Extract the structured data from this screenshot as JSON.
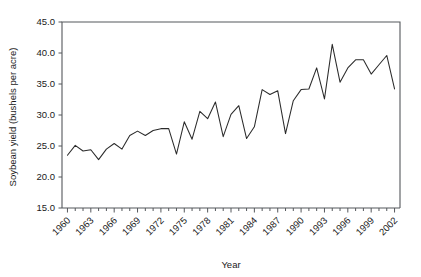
{
  "chart_data": {
    "type": "line",
    "title": "",
    "xlabel": "Year",
    "ylabel": "Soybean yield (bushels per acre)",
    "xlim": [
      1959.3,
      2002.7
    ],
    "ylim": [
      15.0,
      45.0
    ],
    "grid": false,
    "legend": false,
    "y_ticks": [
      "15.0",
      "20.0",
      "25.0",
      "30.0",
      "35.0",
      "40.0",
      "45.0"
    ],
    "y_tick_values": [
      15.0,
      20.0,
      25.0,
      30.0,
      35.0,
      40.0,
      45.0
    ],
    "x_ticks": [
      "1960",
      "1963",
      "1966",
      "1969",
      "1972",
      "1975",
      "1978",
      "1981",
      "1984",
      "1987",
      "1990",
      "1993",
      "1996",
      "1999",
      "2002"
    ],
    "x_tick_values": [
      1960,
      1963,
      1966,
      1969,
      1972,
      1975,
      1978,
      1981,
      1984,
      1987,
      1990,
      1993,
      1996,
      1999,
      2002
    ],
    "x_tick_rotation": 45,
    "x_minor_tick_step": 1,
    "series": [
      {
        "name": "Soybean yield",
        "color": "#2b2b2b",
        "x": [
          1960,
          1961,
          1962,
          1963,
          1964,
          1965,
          1966,
          1967,
          1968,
          1969,
          1970,
          1971,
          1972,
          1973,
          1974,
          1975,
          1976,
          1977,
          1978,
          1979,
          1980,
          1981,
          1982,
          1983,
          1984,
          1985,
          1986,
          1987,
          1988,
          1989,
          1990,
          1991,
          1992,
          1993,
          1994,
          1995,
          1996,
          1997,
          1998,
          1999,
          2000,
          2001,
          2002
        ],
        "values": [
          23.5,
          25.1,
          24.2,
          24.4,
          22.8,
          24.5,
          25.4,
          24.5,
          26.7,
          27.4,
          26.7,
          27.5,
          27.8,
          27.8,
          23.7,
          28.9,
          26.1,
          30.6,
          29.4,
          32.1,
          26.5,
          30.1,
          31.5,
          26.2,
          28.1,
          34.1,
          33.3,
          33.9,
          27.0,
          32.3,
          34.1,
          34.2,
          37.6,
          32.6,
          41.4,
          35.3,
          37.6,
          38.9,
          38.9,
          36.6,
          38.1,
          39.6,
          34.2
        ]
      }
    ]
  }
}
